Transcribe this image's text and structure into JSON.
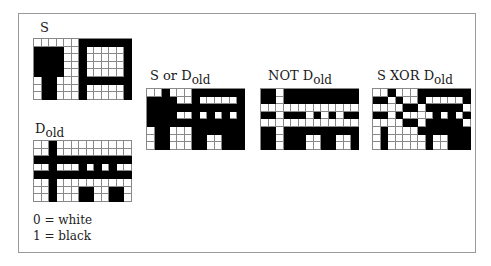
{
  "figure": {
    "legend": {
      "line0": "0 = white",
      "line1": "1 = black"
    },
    "colors": {
      "on": "#000000",
      "off": "#ffffff",
      "gridline": "#888888",
      "frame": "#9a9a9a"
    },
    "grids": [
      {
        "id": "s",
        "label": "S",
        "sub": "",
        "rows": [
          "0000001111111",
          "1111001000001",
          "1111001000001",
          "1111001000001",
          "1111001000001",
          "0110001111111",
          "0110001000001",
          "0110001000001"
        ]
      },
      {
        "id": "d_old",
        "label": "D",
        "sub": "old",
        "rows": [
          "0010000000000",
          "0010000000000",
          "1111111111111",
          "0010001010100",
          "1111111111111",
          "0010000000000",
          "0010001100110",
          "0010001100110"
        ]
      },
      {
        "id": "s_or_d_old",
        "label": "S or D",
        "sub": "old",
        "rows": [
          "0010001111111",
          "1111001000001",
          "1111111111111",
          "1111001010101",
          "1111111111111",
          "0110001111111",
          "0110001100111",
          "0110001100111"
        ]
      },
      {
        "id": "not_d_old",
        "label": "NOT D",
        "sub": "old",
        "rows": [
          "1101111111111",
          "1101111111111",
          "0000000000000",
          "1101110101011",
          "0000000000000",
          "1101111111111",
          "1101110011001",
          "1101110011001"
        ]
      },
      {
        "id": "s_xor_d_old",
        "label": "S XOR D",
        "sub": "old",
        "rows": [
          "0010001111111",
          "1101001000001",
          "0000110111110",
          "1101000010101",
          "0000110111110",
          "0100001111111",
          "0100000100111",
          "0100000100111"
        ]
      }
    ]
  }
}
